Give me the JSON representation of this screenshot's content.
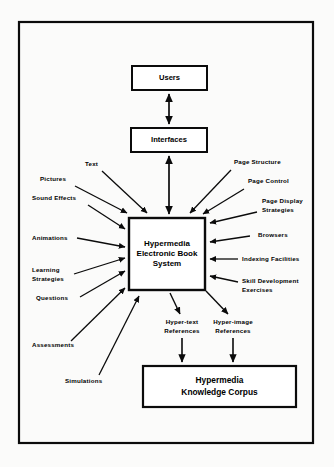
{
  "figure": {
    "background_color": "#fbfbfa",
    "ink_color": "#0b0b0b",
    "frame": {
      "x": 19,
      "y": 22,
      "width": 294,
      "height": 421
    }
  },
  "boxes": {
    "users": {
      "label": "Users",
      "x": 132,
      "y": 66,
      "width": 75,
      "height": 24
    },
    "interfaces": {
      "label": "Interfaces",
      "x": 131,
      "y": 128,
      "width": 76,
      "height": 24
    },
    "core": {
      "line1": "Hypermedia",
      "line2": "Electronic Book",
      "line3": "System",
      "x": 129,
      "y": 218,
      "width": 76,
      "height": 72
    },
    "corpus": {
      "line1": "Hypermedia",
      "line2": "Knowledge Corpus",
      "x": 143,
      "y": 366,
      "width": 153,
      "height": 41
    }
  },
  "left_inputs": [
    {
      "label": "Text",
      "lx": 85,
      "ly": 166,
      "x1": 102,
      "y1": 171,
      "x2": 147,
      "y2": 213
    },
    {
      "label": "Pictures",
      "lx": 40,
      "ly": 181,
      "x1": 75,
      "y1": 186,
      "x2": 127,
      "y2": 213
    },
    {
      "label": "Sound  Effects",
      "lx": 32,
      "ly": 200,
      "x1": 88,
      "y1": 205,
      "x2": 125,
      "y2": 229
    },
    {
      "label": "Animations",
      "lx": 32,
      "ly": 240,
      "x1": 77,
      "y1": 238,
      "x2": 125,
      "y2": 247
    },
    {
      "label": "Learning",
      "lx": 32,
      "ly": 272,
      "x1": 74,
      "y1": 274,
      "x2": 125,
      "y2": 258
    },
    {
      "label": "Strategies",
      "lx": 32,
      "ly": 281,
      "x1": 0,
      "y1": 0,
      "x2": 0,
      "y2": 0
    },
    {
      "label": "Questions",
      "lx": 36,
      "ly": 300,
      "x1": 80,
      "y1": 297,
      "x2": 125,
      "y2": 271
    },
    {
      "label": "Assessments",
      "lx": 32,
      "ly": 347,
      "x1": 71,
      "y1": 341,
      "x2": 125,
      "y2": 288
    },
    {
      "label": "Simulations",
      "lx": 65,
      "ly": 383,
      "x1": 99,
      "y1": 375,
      "x2": 139,
      "y2": 296
    }
  ],
  "right_inputs": [
    {
      "label": "Page  Structure",
      "lx": 234,
      "ly": 164,
      "x1": 231,
      "y1": 170,
      "x2": 190,
      "y2": 213
    },
    {
      "label": "Page  Control",
      "lx": 248,
      "ly": 183,
      "x1": 244,
      "y1": 189,
      "x2": 203,
      "y2": 214
    },
    {
      "label": "Page  Display",
      "lx": 262,
      "ly": 203,
      "x1": 257,
      "y1": 212,
      "x2": 210,
      "y2": 223
    },
    {
      "label": "Strategies",
      "lx": 262,
      "ly": 212,
      "x1": 0,
      "y1": 0,
      "x2": 0,
      "y2": 0
    },
    {
      "label": "Browsers",
      "lx": 258,
      "ly": 237,
      "x1": 250,
      "y1": 236,
      "x2": 210,
      "y2": 242
    },
    {
      "label": "Indexing  Facilities",
      "lx": 242,
      "ly": 261,
      "x1": 238,
      "y1": 259,
      "x2": 210,
      "y2": 259
    },
    {
      "label": "Skill  Development",
      "lx": 242,
      "ly": 283,
      "x1": 238,
      "y1": 282,
      "x2": 210,
      "y2": 276
    },
    {
      "label": "Exercises",
      "lx": 242,
      "ly": 292,
      "x1": 0,
      "y1": 0,
      "x2": 0,
      "y2": 0
    }
  ],
  "references": [
    {
      "line1": "Hyper-text",
      "line2": "References",
      "cx": 182,
      "ly1": 324,
      "ly2": 333,
      "from_x": 170,
      "from_y": 293,
      "to_x": 180,
      "to_y": 314,
      "down_x": 182,
      "down_y1": 338,
      "down_y2": 362
    },
    {
      "line1": "Hyper-image",
      "line2": "References",
      "cx": 233,
      "ly1": 324,
      "ly2": 333,
      "from_x": 206,
      "from_y": 291,
      "to_x": 228,
      "to_y": 314,
      "down_x": 233,
      "down_y1": 338,
      "down_y2": 362
    }
  ],
  "vertical_links": [
    {
      "name": "users-interfaces",
      "x": 169,
      "y1": 94,
      "y2": 124,
      "arrow_up": true,
      "arrow_down": true
    },
    {
      "name": "interfaces-core",
      "x": 169,
      "y1": 156,
      "y2": 214,
      "arrow_up": true,
      "arrow_down": true
    }
  ]
}
